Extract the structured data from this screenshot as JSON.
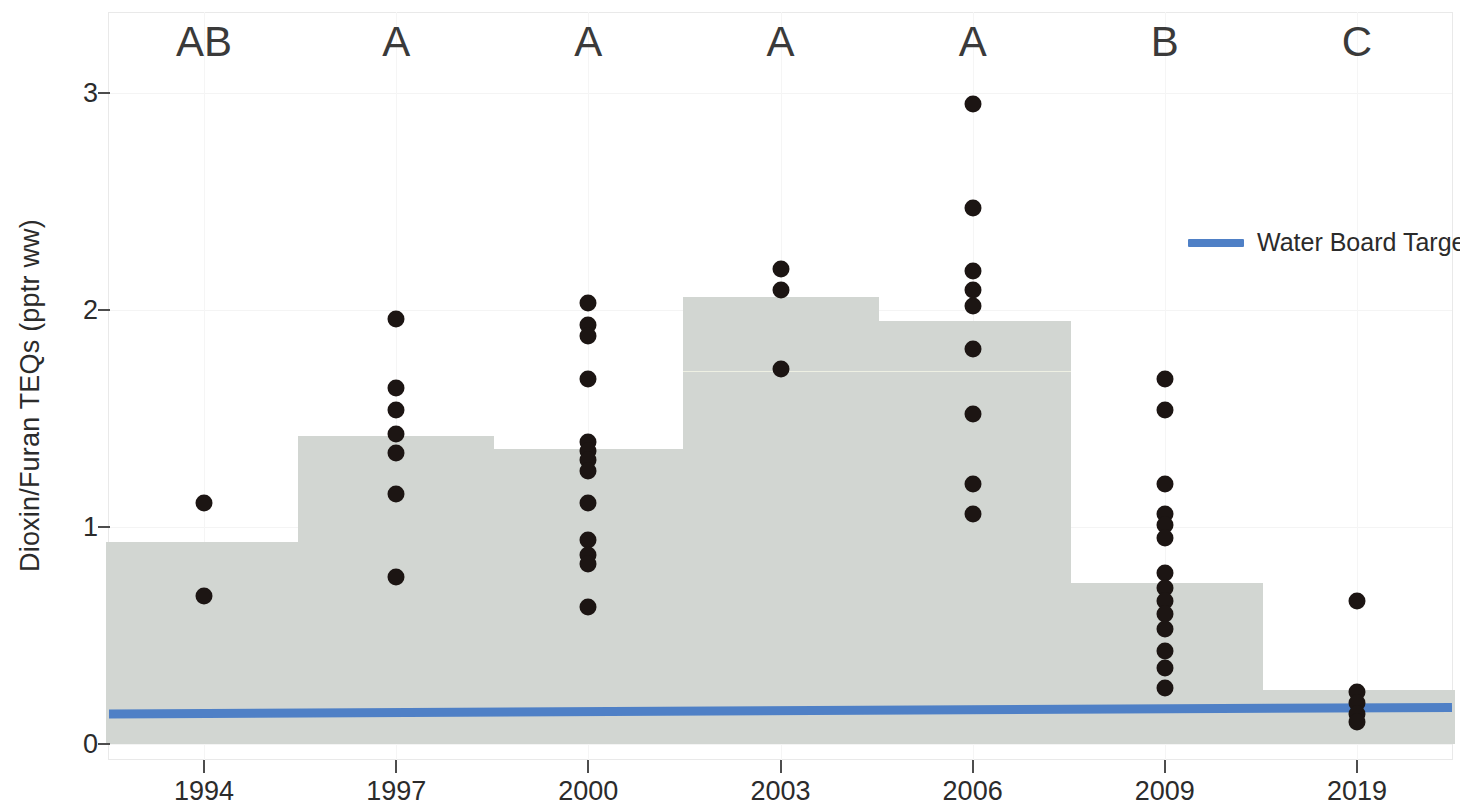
{
  "chart_data": {
    "type": "bar",
    "title": "",
    "subtitle": "",
    "xlabel": "",
    "ylabel": "Dioxin/Furan TEQs (pptr ww)",
    "categories": [
      "1994",
      "1997",
      "2000",
      "2003",
      "2006",
      "2009",
      "2019"
    ],
    "values": [
      0.93,
      1.42,
      1.36,
      2.06,
      1.95,
      0.74,
      0.25
    ],
    "ylim": [
      0,
      3.3
    ],
    "yticks": [
      0,
      1,
      2,
      3
    ],
    "ytick_labels": [
      "0",
      "1",
      "2",
      "3"
    ],
    "grid": false,
    "legend_position": "top-right",
    "group_labels": [
      "AB",
      "A",
      "A",
      "A",
      "A",
      "B",
      "C"
    ],
    "series": [
      {
        "name": "Mean Dioxin/Furan TEQs",
        "type": "bar",
        "color": "#d2d6d2",
        "values": [
          0.93,
          1.42,
          1.36,
          2.06,
          1.95,
          0.74,
          0.25
        ]
      },
      {
        "name": "Water Board Target",
        "type": "line",
        "color": "#4f80c6",
        "x": [
          "1994",
          "2019"
        ],
        "values": [
          0.14,
          0.17
        ]
      }
    ],
    "points": [
      {
        "category": "1994",
        "values": [
          1.11,
          0.68
        ]
      },
      {
        "category": "1997",
        "values": [
          1.96,
          1.64,
          1.54,
          1.43,
          1.34,
          1.15,
          0.77
        ]
      },
      {
        "category": "2000",
        "values": [
          2.03,
          1.93,
          1.88,
          1.68,
          1.39,
          1.35,
          1.31,
          1.26,
          1.11,
          0.94,
          0.87,
          0.83,
          0.63
        ]
      },
      {
        "category": "2003",
        "values": [
          2.19,
          2.09,
          1.73
        ]
      },
      {
        "category": "2006",
        "values": [
          2.95,
          2.47,
          2.18,
          2.09,
          2.02,
          1.82,
          1.52,
          1.2,
          1.06
        ]
      },
      {
        "category": "2009",
        "values": [
          1.68,
          1.54,
          1.2,
          1.06,
          1.01,
          0.95,
          0.79,
          0.72,
          0.66,
          0.6,
          0.53,
          0.43,
          0.35,
          0.26
        ]
      },
      {
        "category": "2019",
        "values": [
          0.66,
          0.24,
          0.19,
          0.14,
          0.1
        ]
      }
    ],
    "point_color": "#1c1513",
    "annotations": []
  },
  "legend": {
    "items": [
      {
        "label": "Water Board Target",
        "color": "#4f80c6",
        "marker": "line"
      }
    ]
  }
}
